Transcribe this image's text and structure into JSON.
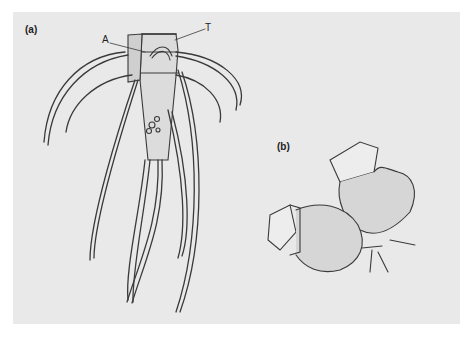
{
  "figure": {
    "panel_a_label": "(a)",
    "panel_b_label": "(b)",
    "annotation_a": "A",
    "annotation_t": "T",
    "background_color": "#e9e9e9",
    "line_color": "#333333"
  }
}
